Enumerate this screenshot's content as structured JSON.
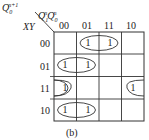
{
  "kmap": {
    "output_label": {
      "base": "Q",
      "sub": "0",
      "sup": "n+1"
    },
    "column_vars": [
      {
        "base": "Q",
        "sub": "1",
        "sup": "n"
      },
      {
        "base": "Q",
        "sub": "0",
        "sup": "n"
      }
    ],
    "row_vars": "XY",
    "column_headers": [
      "00",
      "01",
      "11",
      "10"
    ],
    "row_headers": [
      "00",
      "01",
      "11",
      "10"
    ],
    "cells": [
      [
        "",
        "1",
        "1",
        ""
      ],
      [
        "1",
        "1",
        "",
        ""
      ],
      [
        "1",
        "",
        "",
        "1"
      ],
      [
        "1",
        "1",
        "",
        ""
      ]
    ],
    "groups": [
      {
        "row": 0,
        "cols": [
          1,
          2
        ]
      },
      {
        "row": 1,
        "cols": [
          0,
          1
        ]
      },
      {
        "row": 2,
        "cols": [
          0,
          3
        ],
        "wraps": true
      },
      {
        "row": 3,
        "cols": [
          0,
          1
        ]
      }
    ],
    "line_color": "#333333"
  },
  "caption": "(b)"
}
